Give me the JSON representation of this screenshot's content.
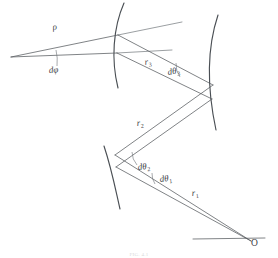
{
  "figure": {
    "caption": "FIG. 4.1",
    "background_color": "#ffffff",
    "ink_color": "#4a4f54",
    "ray_color": "#555a5e"
  },
  "labels": {
    "rho": {
      "text": "ρ",
      "x": 53,
      "y": 30
    },
    "dphi": {
      "text": "dφ",
      "x": 49,
      "y": 73
    },
    "r3": {
      "base": "r",
      "sub": "3",
      "x": 145,
      "y": 65
    },
    "dtheta3": {
      "base": "dθ",
      "sub": "3",
      "x": 168,
      "y": 75
    },
    "r2": {
      "base": "r",
      "sub": "2",
      "x": 137,
      "y": 126
    },
    "dtheta2": {
      "base": "dθ",
      "sub": "2",
      "x": 138,
      "y": 170
    },
    "dtheta1": {
      "base": "dθ",
      "sub": "1",
      "x": 160,
      "y": 182
    },
    "r1": {
      "base": "r",
      "sub": "1",
      "x": 192,
      "y": 196
    },
    "origin": {
      "text": "O",
      "x": 251,
      "y": 246
    }
  },
  "mirrors": [
    {
      "name": "mirror-3-upper-left",
      "path": "M 124 3 C 113 28, 111 60, 118 88"
    },
    {
      "name": "mirror-2-right",
      "path": "M 218 15 C 207 48, 207 88, 216 130"
    },
    {
      "name": "mirror-1-lower-left",
      "path": "M 104 146 C 112 170, 116 192, 120 209"
    }
  ],
  "rays": {
    "pencil_from_vertex": [
      {
        "name": "ray-upper-to-mirror3",
        "path": "M 11 57 L 118 35"
      },
      {
        "name": "ray-lower-to-mirror3",
        "path": "M 11 57 L 117 53"
      },
      {
        "name": "ray-upper-beyond",
        "path": "M 118 35 L 182 22"
      },
      {
        "name": "ray-lower-beyond",
        "path": "M 117 53 L 172 50"
      }
    ],
    "segment_r3": [
      {
        "name": "ray-r3-upper",
        "path": "M 118 35 L 213 85"
      },
      {
        "name": "ray-r3-lower",
        "path": "M 117 53 L 212 99"
      }
    ],
    "segment_r2": [
      {
        "name": "ray-r2-upper",
        "path": "M 213 85 L 115 155"
      },
      {
        "name": "ray-r2-lower",
        "path": "M 212 99 L 116 167"
      }
    ],
    "segment_r1": [
      {
        "name": "ray-r1-upper",
        "path": "M 115 155 L 251 241"
      },
      {
        "name": "ray-r1-lower",
        "path": "M 116 167 L 251 241"
      }
    ],
    "baseline": {
      "name": "optical-axis-baseline",
      "path": "M 193 239 L 265 238"
    }
  },
  "angle_marks": [
    {
      "name": "angle-mark-dphi",
      "path": "M 56 50 A 46 46 0 0 1 57 66"
    },
    {
      "name": "angle-mark-dtheta3",
      "path": "M 176 63 A 22 22 0 0 0 180 77"
    },
    {
      "name": "angle-mark-dtheta2",
      "path": "M 132 152 A 20 20 0 0 0 137 165"
    },
    {
      "name": "angle-mark-dtheta1",
      "path": "M 152 173 A 18 18 0 0 0 155 184"
    }
  ]
}
